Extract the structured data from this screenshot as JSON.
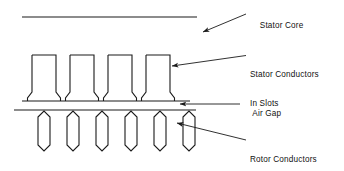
{
  "diagram": {
    "stroke_color": "#1a1a1a",
    "background_color": "#ffffff",
    "labels": {
      "stator_core": "Stator Core",
      "stator_conductors_line1": "Stator Conductors",
      "stator_conductors_line2": "In Slots",
      "air_gap": "Air Gap",
      "rotor_conductors_line1": "Rotor Conductors",
      "rotor_conductors_line2": "In Slots"
    },
    "parts": {
      "stator_core_back_line": "stator-core-back-iron-line",
      "stator_base_line": "stator-tooth-base-line",
      "rotor_surface_line": "rotor-surface-line",
      "stator_slot_count": 4,
      "rotor_slot_count": 6
    },
    "geometry": {
      "stator_core_line": {
        "x1": 22,
        "x2": 197,
        "y": 17
      },
      "stator_base_line": {
        "x1": 22,
        "x2": 190,
        "y": 101
      },
      "rotor_surface_line": {
        "x1": 14,
        "x2": 196,
        "y": 110
      },
      "stator_slots": [
        {
          "x": 32,
          "y": 55,
          "w": 24,
          "h": 37
        },
        {
          "x": 70,
          "y": 55,
          "w": 24,
          "h": 37
        },
        {
          "x": 108,
          "y": 55,
          "w": 24,
          "h": 37
        },
        {
          "x": 146,
          "y": 55,
          "w": 24,
          "h": 37
        }
      ],
      "rotor_slots": [
        {
          "cx": 44,
          "y": 112,
          "w": 22,
          "h": 40
        },
        {
          "cx": 73,
          "y": 112,
          "w": 22,
          "h": 40
        },
        {
          "cx": 102,
          "y": 112,
          "w": 22,
          "h": 40
        },
        {
          "cx": 131,
          "y": 112,
          "w": 22,
          "h": 40
        },
        {
          "cx": 160,
          "y": 112,
          "w": 22,
          "h": 40
        },
        {
          "cx": 189,
          "y": 112,
          "w": 22,
          "h": 40
        }
      ],
      "leaders": [
        {
          "name": "stator-core-leader",
          "from": [
            246,
            14
          ],
          "to": [
            199,
            33
          ]
        },
        {
          "name": "stator-conductors-leader",
          "from": [
            246,
            55
          ],
          "to": [
            167,
            66
          ]
        },
        {
          "name": "air-gap-leader",
          "from": [
            240,
            104
          ],
          "to": [
            175,
            104
          ]
        },
        {
          "name": "rotor-conductors-leader",
          "from": [
            246,
            140
          ],
          "to": [
            172,
            122
          ]
        }
      ]
    }
  }
}
